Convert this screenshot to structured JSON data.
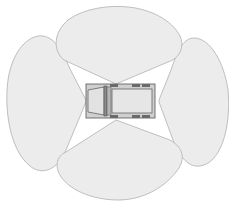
{
  "diagram": {
    "description": "Top-down view of a vehicle with four surrounding coverage zones",
    "colors": {
      "background": "#ffffff",
      "zone_fill": "#ececec",
      "zone_stroke": "#b0b0b0",
      "vehicle_body": "#e4e4e4",
      "vehicle_outline": "#555555",
      "vehicle_dark": "#7a7a7a",
      "vehicle_cab": "#d6d6d6"
    },
    "zones": [
      {
        "name": "front-zone",
        "position": "top"
      },
      {
        "name": "rear-zone",
        "position": "bottom"
      },
      {
        "name": "left-zone",
        "position": "left"
      },
      {
        "name": "right-zone",
        "position": "right"
      }
    ],
    "vehicle": {
      "type": "truck",
      "orientation": "cab facing left"
    }
  }
}
